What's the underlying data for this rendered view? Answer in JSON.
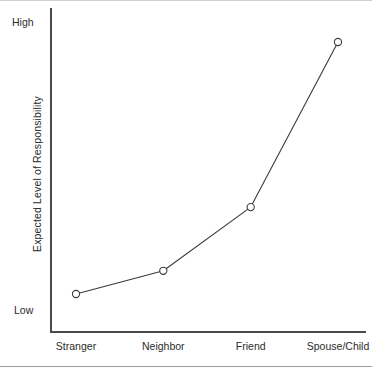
{
  "figure": {
    "background_color": "#ffffff",
    "axis_color": "#4a4a4a",
    "line_color": "#3a3a3a",
    "marker_fill": "#ffffff"
  },
  "chart_data": {
    "type": "line",
    "title": "",
    "subtitle": "",
    "xlabel": "",
    "ylabel": "Expected Level of Responsibility",
    "categories": [
      "Stranger",
      "Neighbor",
      "Friend",
      "Spouse/Child"
    ],
    "values": [
      0.13,
      0.21,
      0.43,
      1.0
    ],
    "series": [
      {
        "name": "Expected Level of Responsibility",
        "values": [
          0.13,
          0.21,
          0.43,
          1.0
        ]
      }
    ],
    "ylim": [
      0,
      1
    ],
    "y_tick_labels": [
      "Low",
      "High"
    ],
    "y_axis_low_label": "Low",
    "y_axis_high_label": "High",
    "x_tick_labels": [
      "Stranger",
      "Neighbor",
      "Friend",
      "Spouse/Child"
    ],
    "grid": false,
    "legend": false,
    "legend_position": "none",
    "marker": "open-circle",
    "annotations": []
  },
  "axis": {
    "y_high_label": "High",
    "y_low_label": "Low",
    "y_title": "Expected Level of Responsibility"
  },
  "categories": [
    {
      "label": "Stranger"
    },
    {
      "label": "Neighbor"
    },
    {
      "label": "Friend"
    },
    {
      "label": "Spouse/Child"
    }
  ]
}
